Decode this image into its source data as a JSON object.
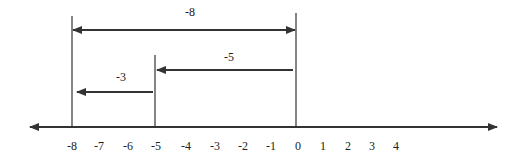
{
  "diagram": {
    "type": "number-line",
    "colors": {
      "line": "#333333",
      "text": "#222222",
      "background": "#ffffff"
    },
    "axis": {
      "y": 127,
      "x_start": 30,
      "x_end": 497,
      "arrows": "both",
      "ticks": [
        {
          "label": "-8",
          "x": 72
        },
        {
          "label": "-7",
          "x": 99
        },
        {
          "label": "-6",
          "x": 128
        },
        {
          "label": "-5",
          "x": 156
        },
        {
          "label": "-4",
          "x": 186
        },
        {
          "label": "-3",
          "x": 215
        },
        {
          "label": "-2",
          "x": 243
        },
        {
          "label": "-1",
          "x": 271
        },
        {
          "label": "0",
          "x": 298
        },
        {
          "label": "1",
          "x": 323
        },
        {
          "label": "2",
          "x": 348
        },
        {
          "label": "3",
          "x": 372
        },
        {
          "label": "4",
          "x": 396
        }
      ]
    },
    "markers": [
      {
        "at": "-8",
        "x": 72,
        "y_top": 16,
        "y_bottom": 128
      },
      {
        "at": "-5",
        "x": 155,
        "y_top": 55,
        "y_bottom": 126
      },
      {
        "at": "0",
        "x": 296,
        "y_top": 13,
        "y_bottom": 128
      }
    ],
    "arrows": [
      {
        "label": "-8",
        "from": "0",
        "to": "-8",
        "y": 30,
        "x1": 73,
        "x2": 295,
        "heads": "both",
        "label_x": 190,
        "label_y": 16
      },
      {
        "label": "-5",
        "from": "0",
        "to": "-5",
        "y": 70,
        "x1": 157,
        "x2": 293,
        "heads": "left",
        "label_x": 229,
        "label_y": 61
      },
      {
        "label": "-3",
        "from": "-5",
        "to": "-8",
        "y": 92,
        "x1": 77,
        "x2": 153,
        "heads": "left",
        "label_x": 121,
        "label_y": 81
      }
    ]
  }
}
